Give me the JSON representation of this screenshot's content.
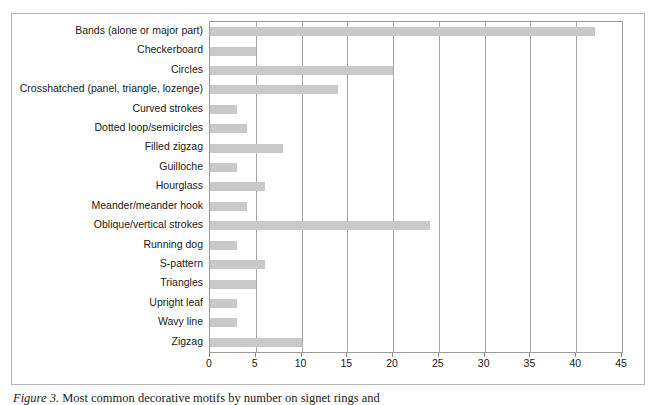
{
  "figure": {
    "caption_label": "Figure 3.",
    "caption_text": "Most common decorative motifs by number on signet rings and"
  },
  "axis": {
    "x_ticks": [
      "0",
      "5",
      "10",
      "15",
      "20",
      "25",
      "30",
      "35",
      "40",
      "45"
    ]
  },
  "chart_data": {
    "type": "bar",
    "orientation": "horizontal",
    "title": "",
    "xlabel": "",
    "ylabel": "",
    "xlim": [
      0,
      45
    ],
    "xticks": [
      0,
      5,
      10,
      15,
      20,
      25,
      30,
      35,
      40,
      45
    ],
    "grid": true,
    "legend": "none",
    "bar_color": "#c9c9c9",
    "categories": [
      "Bands (alone or major part)",
      "Checkerboard",
      "Circles",
      "Crosshatched (panel, triangle, lozenge)",
      "Curved strokes",
      "Dotted loop/semicircles",
      "Filled zigzag",
      "Guilloche",
      "Hourglass",
      "Meander/meander hook",
      "Oblique/vertical strokes",
      "Running dog",
      "S-pattern",
      "Triangles",
      "Upright leaf",
      "Wavy line",
      "Zigzag"
    ],
    "values": [
      42,
      5,
      20,
      14,
      3,
      4,
      8,
      3,
      6,
      4,
      24,
      3,
      6,
      5,
      3,
      3,
      10
    ]
  }
}
